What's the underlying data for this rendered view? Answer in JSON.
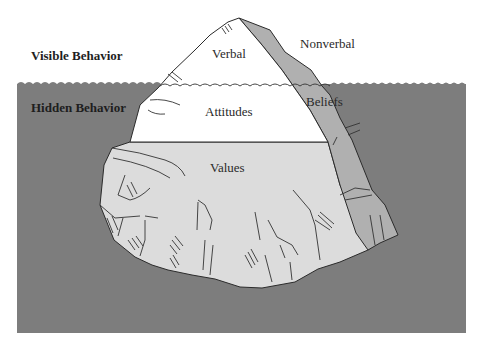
{
  "diagram": {
    "labels": {
      "visible_behavior": "Visible Behavior",
      "hidden_behavior": "Hidden Behavior",
      "verbal": "Verbal",
      "nonverbal": "Nonverbal",
      "attitudes": "Attitudes",
      "beliefs": "Beliefs",
      "values": "Values"
    },
    "colors": {
      "background": "#ffffff",
      "water": "#7d7d7d",
      "iceberg_white": "#ffffff",
      "beliefs_gray": "#b0b0b0",
      "values_gray": "#dcdcdc",
      "outline": "#2b2b2b",
      "text": "#222222"
    }
  }
}
